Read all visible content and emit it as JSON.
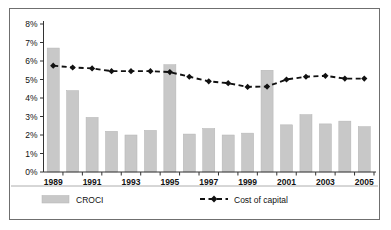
{
  "chart_data": {
    "type": "bar",
    "title": "",
    "xlabel": "",
    "ylabel": "",
    "ylim": [
      0,
      8
    ],
    "y_tick_suffix": "%",
    "y_ticks": [
      "0%",
      "1%",
      "2%",
      "3%",
      "4%",
      "5%",
      "6%",
      "7%",
      "8%"
    ],
    "y_tick_values": [
      0,
      1,
      2,
      3,
      4,
      5,
      6,
      7,
      8
    ],
    "grid": false,
    "legend_position": "bottom",
    "categories": [
      1989,
      1990,
      1991,
      1992,
      1993,
      1994,
      1995,
      1996,
      1997,
      1998,
      1999,
      2000,
      2001,
      2002,
      2003,
      2004,
      2005
    ],
    "x_tick_labels": [
      "1989",
      "",
      "1991",
      "",
      "1993",
      "",
      "1995",
      "",
      "1997",
      "",
      "1999",
      "",
      "2001",
      "",
      "2003",
      "",
      "2005"
    ],
    "series": [
      {
        "name": "CROCI",
        "type": "bar",
        "color": "#c8c8c8",
        "values": [
          6.7,
          4.4,
          2.95,
          2.2,
          2.0,
          2.25,
          5.8,
          2.05,
          2.35,
          2.0,
          2.1,
          5.5,
          2.55,
          3.1,
          2.6,
          2.75,
          2.45
        ]
      },
      {
        "name": "Cost of capital",
        "type": "line",
        "color": "#111111",
        "marker": "diamond",
        "linestyle": "dashed",
        "values": [
          5.75,
          5.65,
          5.6,
          5.45,
          5.45,
          5.45,
          5.4,
          5.15,
          4.9,
          4.8,
          4.6,
          4.62,
          5.0,
          5.15,
          5.2,
          5.05,
          5.05
        ]
      }
    ]
  },
  "legend": {
    "items": [
      {
        "label": "CROCI",
        "swatch": "bar-swatch",
        "color": "#c8c8c8"
      },
      {
        "label": "Cost of capital",
        "swatch": "dashed-diamond-swatch",
        "color": "#111111"
      }
    ]
  }
}
